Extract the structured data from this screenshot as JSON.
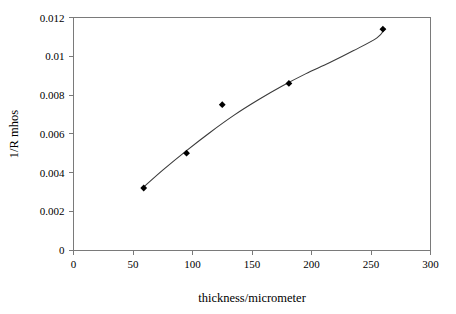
{
  "chart_data": {
    "type": "scatter",
    "title": "",
    "xlabel": "thickness/micrometer",
    "ylabel": "1/R mhos",
    "xlim": [
      0,
      300
    ],
    "ylim": [
      0,
      0.012
    ],
    "grid": false,
    "legend": false,
    "legend_position": "none",
    "marker": "filled-diamond",
    "marker_color": "#000000",
    "curve_color": "#3a3a3a",
    "frame_color": "#7a7a7a",
    "background": "#ffffff",
    "xticks": [
      "0",
      "50",
      "100",
      "150",
      "200",
      "250",
      "300"
    ],
    "xtick_values": [
      0,
      50,
      100,
      150,
      200,
      250,
      300
    ],
    "yticks": [
      "0",
      "0.002",
      "0.004",
      "0.006",
      "0.008",
      "0.01",
      "0.012"
    ],
    "ytick_values": [
      0,
      0.002,
      0.004,
      0.006,
      0.008,
      0.01,
      0.012
    ],
    "x": [
      59,
      95,
      125,
      181,
      260
    ],
    "y": [
      0.0032,
      0.005,
      0.0075,
      0.0086,
      0.0114
    ],
    "series": [
      {
        "name": "1/R vs thickness",
        "points": [
          {
            "x": 59,
            "y": 0.0032
          },
          {
            "x": 95,
            "y": 0.005
          },
          {
            "x": 125,
            "y": 0.0075
          },
          {
            "x": 181,
            "y": 0.0086
          },
          {
            "x": 260,
            "y": 0.0114
          }
        ]
      }
    ],
    "fit_curve": {
      "description": "smooth increasing concave trend line through data",
      "points": [
        {
          "x": 59,
          "y": 0.00325
        },
        {
          "x": 75,
          "y": 0.00412
        },
        {
          "x": 95,
          "y": 0.00513
        },
        {
          "x": 115,
          "y": 0.00608
        },
        {
          "x": 135,
          "y": 0.00696
        },
        {
          "x": 155,
          "y": 0.00774
        },
        {
          "x": 175,
          "y": 0.00845
        },
        {
          "x": 195,
          "y": 0.00909
        },
        {
          "x": 215,
          "y": 0.00966
        },
        {
          "x": 235,
          "y": 0.01028
        },
        {
          "x": 255,
          "y": 0.01095
        },
        {
          "x": 262,
          "y": 0.01145
        }
      ]
    }
  }
}
